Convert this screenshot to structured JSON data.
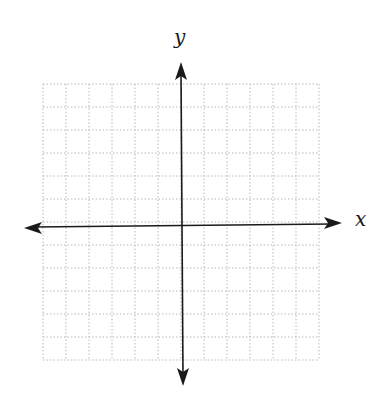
{
  "diagram": {
    "type": "coordinate-plane",
    "x_axis_label": "x",
    "y_axis_label": "y",
    "grid": {
      "columns": 12,
      "rows": 12,
      "style": "dotted",
      "color": "#b8b8b8",
      "left": 43,
      "top": 84,
      "cell_size": 23
    },
    "axes": {
      "color": "#1a1a1a",
      "x_axis": {
        "y": 225,
        "x_start": 24,
        "x_end": 342,
        "arrows": "both"
      },
      "y_axis": {
        "x": 182,
        "y_start": 62,
        "y_end": 386,
        "arrows": "both"
      }
    }
  }
}
